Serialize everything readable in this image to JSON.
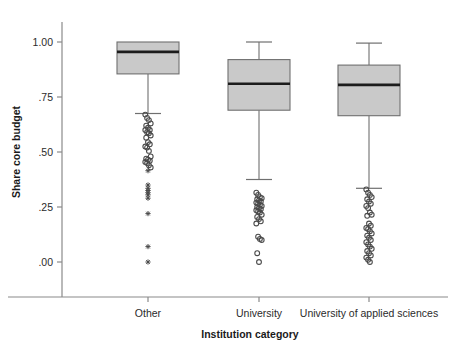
{
  "chart_data": {
    "type": "box",
    "title": "",
    "xlabel": "Institution category",
    "ylabel": "Share core budget",
    "categories": [
      "Other",
      "University",
      "University of applied sciences"
    ],
    "ylim": [
      0.0,
      1.0
    ],
    "ytick_values": [
      1.0,
      0.75,
      0.5,
      0.25,
      0.0
    ],
    "ytick_labels": [
      "1.00",
      ".75",
      ".50",
      ".25",
      ".00"
    ],
    "grid": false,
    "legend": "none",
    "boxes": [
      {
        "category": "Other",
        "whisker_high": 1.0,
        "q3": 1.0,
        "median": 0.955,
        "q1": 0.855,
        "whisker_low": 0.675,
        "outlier_circles": [
          0.67,
          0.655,
          0.645,
          0.63,
          0.62,
          0.61,
          0.6,
          0.6,
          0.59,
          0.585,
          0.575,
          0.565,
          0.545,
          0.535,
          0.525,
          0.52,
          0.505,
          0.48,
          0.47,
          0.465,
          0.46,
          0.455,
          0.45,
          0.44,
          0.43
        ],
        "outlier_stars": [
          0.415,
          0.35,
          0.335,
          0.325,
          0.315,
          0.305,
          0.29,
          0.22,
          0.07,
          0.0
        ]
      },
      {
        "category": "University",
        "whisker_high": 1.0,
        "q3": 0.92,
        "median": 0.81,
        "q1": 0.69,
        "whisker_low": 0.375,
        "outlier_circles": [
          0.315,
          0.305,
          0.295,
          0.29,
          0.285,
          0.28,
          0.275,
          0.27,
          0.265,
          0.26,
          0.255,
          0.25,
          0.245,
          0.24,
          0.235,
          0.23,
          0.225,
          0.215,
          0.205,
          0.195,
          0.185,
          0.175,
          0.115,
          0.105,
          0.1,
          0.04,
          0.0
        ],
        "outlier_stars": []
      },
      {
        "category": "University of applied sciences",
        "whisker_high": 0.995,
        "q3": 0.895,
        "median": 0.805,
        "q1": 0.665,
        "whisker_low": 0.335,
        "outlier_circles": [
          0.33,
          0.315,
          0.305,
          0.295,
          0.285,
          0.275,
          0.265,
          0.255,
          0.245,
          0.225,
          0.215,
          0.21,
          0.175,
          0.165,
          0.155,
          0.15,
          0.14,
          0.13,
          0.12,
          0.11,
          0.1,
          0.09,
          0.08,
          0.07,
          0.06,
          0.05,
          0.04,
          0.03,
          0.02,
          0.01,
          0.0
        ],
        "outlier_stars": []
      }
    ],
    "colors": {
      "box_fill": "#c9c9c9",
      "box_stroke": "#6f6f6f",
      "median": "#1c1c1c",
      "outlier": "#4a4a4a",
      "axis": "#8a8a8a",
      "text": "#1a1a1a",
      "background": "#ffffff"
    }
  }
}
